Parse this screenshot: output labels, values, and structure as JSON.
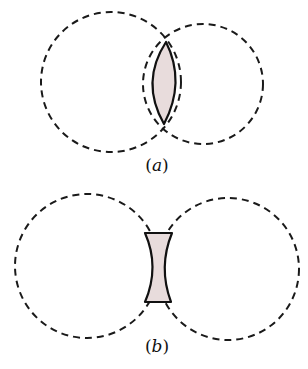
{
  "colors": {
    "lens_fill": "#e8dcdc",
    "stroke": "#1a1a1a",
    "background": "#ffffff"
  },
  "diagrams": [
    {
      "id": "a",
      "label_open": "(",
      "label_letter": "a",
      "label_close": ")",
      "description": "Two overlapping dashed circles with a shaded convex (biconvex) lens at their intersection"
    },
    {
      "id": "b",
      "label_open": "(",
      "label_letter": "b",
      "label_close": ")",
      "description": "Two nearly touching dashed circles with a shaded concave (biconcave) lens in the gap between them"
    }
  ]
}
